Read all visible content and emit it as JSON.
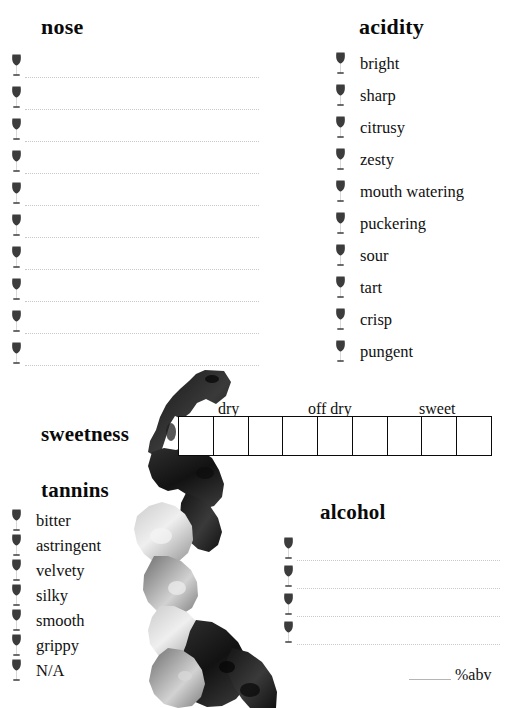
{
  "sections": {
    "nose": {
      "heading": "nose",
      "line_count": 10,
      "glass_icon": "wine-glass-icon"
    },
    "acidity": {
      "heading": "acidity",
      "glass_icon": "wine-glass-icon",
      "options": [
        "bright",
        "sharp",
        "citrusy",
        "zesty",
        "mouth watering",
        "puckering",
        "sour",
        "tart",
        "crisp",
        "pungent"
      ]
    },
    "sweetness": {
      "heading": "sweetness",
      "cell_count": 9,
      "tick_labels": [
        "dry",
        "off dry",
        "sweet"
      ]
    },
    "tannins": {
      "heading": "tannins",
      "glass_icon": "wine-glass-icon",
      "options": [
        "bitter",
        "astringent",
        "velvety",
        "silky",
        "smooth",
        "grippy",
        "N/A"
      ]
    },
    "alcohol": {
      "heading": "alcohol",
      "line_count": 4,
      "glass_icon": "wine-glass-icon",
      "abv": {
        "value": "",
        "label": "%abv"
      }
    }
  },
  "background": {
    "image_name": "watercolor-map-illustration",
    "palette": [
      "#1a1a1a",
      "#4d4d4d",
      "#8c8c8c",
      "#c4c4c4",
      "#e8e8e8"
    ]
  },
  "colors": {
    "ink": "#0a0a0a",
    "rule": "#c9c9c9",
    "glass": "#3c3c3c",
    "box_border": "#0a0a0a"
  }
}
